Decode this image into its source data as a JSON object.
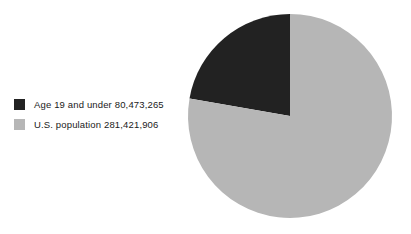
{
  "chart_data": {
    "type": "pie",
    "title": "",
    "subtitle": "",
    "xlabel": "",
    "ylabel": "",
    "legend_position": "left",
    "grid": false,
    "start_angle_deg": 90,
    "direction": "counterclockwise",
    "categories": [
      "Age 19 and under",
      "U.S. population"
    ],
    "values": [
      80473265,
      281421906
    ],
    "value_labels": [
      "80,473,265",
      "281,421,906"
    ],
    "slice_fractions": [
      0.2859,
      0.7141
    ],
    "slice_percent_labels": [
      "28.6%",
      "71.4%"
    ],
    "colors": [
      "#222222",
      "#b6b6b6"
    ],
    "slices": [
      {
        "name": "Age 19 and under",
        "value": 80473265,
        "value_label": "80,473,265",
        "legend_text": "Age 19 and under 80,473,265",
        "color": "#222222",
        "fraction": 0.2859,
        "sweep_deg": 102.9
      },
      {
        "name": "U.S. population",
        "value": 281421906,
        "value_label": "281,421,906",
        "legend_text": "U.S. population 281,421,906",
        "color": "#b6b6b6",
        "fraction": 0.7141,
        "sweep_deg": 257.1
      }
    ],
    "geometry": {
      "center_x": 290,
      "center_y": 116,
      "radius": 102
    }
  },
  "legend": {
    "items": [
      {
        "label": "Age 19 and under 80,473,265",
        "swatch_color": "#222222",
        "swatch_name": "legend-swatch-dark"
      },
      {
        "label": "U.S. population 281,421,906",
        "swatch_color": "#b6b6b6",
        "swatch_name": "legend-swatch-light"
      }
    ]
  },
  "page": {
    "background_color": "#ffffff",
    "width": 411,
    "height": 234
  }
}
